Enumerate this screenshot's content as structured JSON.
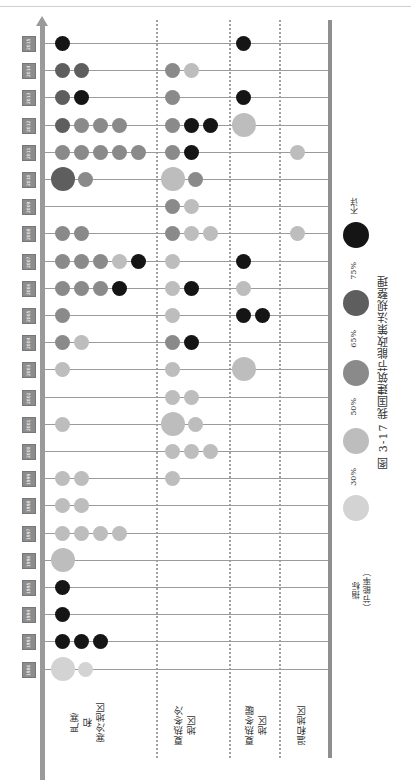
{
  "chart_data": {
    "type": "timeline-bubble",
    "title": "图 3-17 我国建筑节能政策法规整理",
    "orientation": "rotated-90ccw",
    "legend_title": "指标\n（节能率）",
    "legend": [
      {
        "key": "c30",
        "label": "30%",
        "color": "#d3d3d3"
      },
      {
        "key": "c50",
        "label": "50%",
        "color": "#bdbdbd"
      },
      {
        "key": "c65",
        "label": "65%",
        "color": "#8a8a8a"
      },
      {
        "key": "c75",
        "label": "75%",
        "color": "#5e5e5e"
      },
      {
        "key": "cu",
        "label": "不详",
        "color": "#151515"
      }
    ],
    "zones": [
      {
        "id": "z1",
        "label": "严寒\n和\n寒冷地区"
      },
      {
        "id": "z2",
        "label": "夏热冬冷\n地区"
      },
      {
        "id": "z3",
        "label": "夏热冬暖\n地区"
      },
      {
        "id": "z4",
        "label": "温和地区"
      }
    ],
    "years": [
      "2015",
      "2014",
      "2013",
      "2012",
      "2011",
      "2010",
      "2009",
      "2008",
      "2007",
      "2006",
      "2005",
      "2004",
      "2003",
      "2002",
      "2001",
      "2000",
      "1999",
      "1998",
      "1997",
      "1996",
      "1995",
      "1994",
      "1993",
      "1986"
    ],
    "rows": [
      {
        "year": "2015",
        "z1": [
          "cu"
        ],
        "z2": [],
        "z3": [
          "cu"
        ],
        "z4": []
      },
      {
        "year": "2014",
        "z1": [
          "c75",
          "c75"
        ],
        "z2": [
          "c65",
          "c50"
        ],
        "z3": [],
        "z4": []
      },
      {
        "year": "2013",
        "z1": [
          "c75",
          "cu"
        ],
        "z2": [
          "c65"
        ],
        "z3": [
          "cu"
        ],
        "z4": []
      },
      {
        "year": "2012",
        "z1": [
          "c75",
          "c65",
          "c65",
          "c65"
        ],
        "z2": [
          "c65",
          "cu",
          "cu"
        ],
        "z3": [
          "c50-big"
        ],
        "z4": []
      },
      {
        "year": "2011",
        "z1": [
          "c65",
          "c65",
          "c65",
          "c65",
          "c65"
        ],
        "z2": [
          "c65",
          "cu"
        ],
        "z3": [],
        "z4": [
          "c50"
        ]
      },
      {
        "year": "2010",
        "z1": [
          "c75-big",
          "c65"
        ],
        "z2": [
          "c50-big",
          "c65"
        ],
        "z3": [],
        "z4": []
      },
      {
        "year": "2009",
        "z1": [],
        "z2": [
          "c65",
          "c50"
        ],
        "z3": [],
        "z4": []
      },
      {
        "year": "2008",
        "z1": [
          "c65",
          "c65"
        ],
        "z2": [
          "c65",
          "c50",
          "c50"
        ],
        "z3": [],
        "z4": [
          "c50"
        ]
      },
      {
        "year": "2007",
        "z1": [
          "c65",
          "c65",
          "c65",
          "c50",
          "cu"
        ],
        "z2": [
          "c50"
        ],
        "z3": [
          "cu"
        ],
        "z4": []
      },
      {
        "year": "2006",
        "z1": [
          "c65",
          "c65",
          "c65",
          "cu"
        ],
        "z2": [
          "c50",
          "cu"
        ],
        "z3": [
          "c50"
        ],
        "z4": []
      },
      {
        "year": "2005",
        "z1": [
          "c65"
        ],
        "z2": [
          "c50"
        ],
        "z3": [
          "cu",
          "cu"
        ],
        "z4": []
      },
      {
        "year": "2004",
        "z1": [
          "c65",
          "c50"
        ],
        "z2": [
          "c65",
          "cu"
        ],
        "z3": [],
        "z4": []
      },
      {
        "year": "2003",
        "z1": [
          "c50"
        ],
        "z2": [
          "c50"
        ],
        "z3": [
          "c50-big"
        ],
        "z4": []
      },
      {
        "year": "2002",
        "z1": [],
        "z2": [
          "c50",
          "c50"
        ],
        "z3": [],
        "z4": []
      },
      {
        "year": "2001",
        "z1": [
          "c50"
        ],
        "z2": [
          "c50-big",
          "c50"
        ],
        "z3": [],
        "z4": []
      },
      {
        "year": "2000",
        "z1": [],
        "z2": [
          "c50",
          "c50",
          "c50"
        ],
        "z3": [],
        "z4": []
      },
      {
        "year": "1999",
        "z1": [
          "c50",
          "c50"
        ],
        "z2": [
          "c50"
        ],
        "z3": [],
        "z4": []
      },
      {
        "year": "1998",
        "z1": [
          "c50",
          "c50"
        ],
        "z2": [],
        "z3": [],
        "z4": []
      },
      {
        "year": "1997",
        "z1": [
          "c50",
          "c50",
          "c50",
          "c50"
        ],
        "z2": [],
        "z3": [],
        "z4": []
      },
      {
        "year": "1996",
        "z1": [
          "c50-big"
        ],
        "z2": [],
        "z3": [],
        "z4": []
      },
      {
        "year": "1995",
        "z1": [
          "cu"
        ],
        "z2": [],
        "z3": [],
        "z4": []
      },
      {
        "year": "1994",
        "z1": [
          "cu"
        ],
        "z2": [],
        "z3": [],
        "z4": []
      },
      {
        "year": "1993",
        "z1": [
          "cu",
          "cu",
          "cu"
        ],
        "z2": [],
        "z3": [],
        "z4": []
      },
      {
        "year": "1986",
        "z1": [
          "c30-big",
          "c30"
        ],
        "z2": [],
        "z3": [],
        "z4": []
      }
    ]
  },
  "caption": "图 3-17  我国建筑节能政策法规整理",
  "legend": {
    "title": "指标\n（节能率）",
    "items": [
      "30%",
      "50%",
      "65%",
      "75%",
      "不详"
    ]
  },
  "zones": {
    "z1": "严寒\n和\n寒冷地区",
    "z2": "夏热冬冷\n地区",
    "z3": "夏热冬暖\n地区",
    "z4": "温和地区"
  }
}
